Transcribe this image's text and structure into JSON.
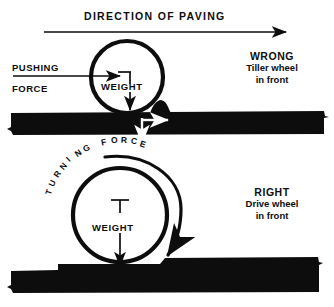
{
  "diagram": {
    "title": "DIRECTION OF PAVING",
    "background_color": "#ffffff",
    "ink_color": "#0d0d0d",
    "top_panel": {
      "verdict": "WRONG",
      "detail_line_1": "Tiller wheel",
      "detail_line_2": "in front",
      "force_label_line_1": "PUSHING",
      "force_label_line_2": "FORCE",
      "weight_label": "WEIGHT"
    },
    "bottom_panel": {
      "verdict": "RIGHT",
      "detail_line_1": "Drive wheel",
      "detail_line_2": "in front",
      "turning_force_label": "TURNING FORCE",
      "weight_label": "WEIGHT"
    }
  }
}
